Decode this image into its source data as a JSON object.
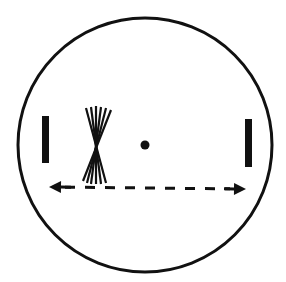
{
  "diagram": {
    "width": 286,
    "height": 282,
    "background": "#ffffff",
    "ink": "#111111",
    "circle": {
      "cx": 145,
      "cy": 145,
      "r": 127,
      "stroke_width": 3
    },
    "left_bar": {
      "x": 42,
      "y": 116,
      "width": 7,
      "height": 47
    },
    "right_bar": {
      "x": 245,
      "y": 119,
      "width": 7,
      "height": 48
    },
    "center_dot": {
      "cx": 145,
      "cy": 145,
      "r": 4.5
    },
    "fan": {
      "pinch": {
        "x": 96,
        "y": 146
      },
      "lines": [
        {
          "x1": 86,
          "y1": 108,
          "x2": 106,
          "y2": 183
        },
        {
          "x1": 91,
          "y1": 107,
          "x2": 101,
          "y2": 184
        },
        {
          "x1": 96,
          "y1": 106,
          "x2": 96,
          "y2": 184
        },
        {
          "x1": 101,
          "y1": 107,
          "x2": 91,
          "y2": 184
        },
        {
          "x1": 106,
          "y1": 108,
          "x2": 87,
          "y2": 183
        },
        {
          "x1": 111,
          "y1": 110,
          "x2": 83,
          "y2": 181
        }
      ]
    },
    "arrow": {
      "x1": 49,
      "y1": 187,
      "x2": 246,
      "y2": 189,
      "dash": "10 10",
      "bidirectional": true
    }
  }
}
